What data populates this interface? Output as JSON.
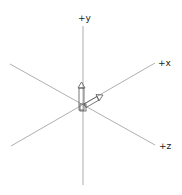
{
  "diagram": {
    "type": "3d-coordinate-axes",
    "axes": [
      {
        "name": "y",
        "label": "+y"
      },
      {
        "name": "x",
        "label": "+x"
      },
      {
        "name": "z",
        "label": "+z"
      }
    ],
    "colors": {
      "line": "#9a9a9a",
      "arrow": "#666666",
      "text": "#222222",
      "background": "#ffffff"
    }
  }
}
